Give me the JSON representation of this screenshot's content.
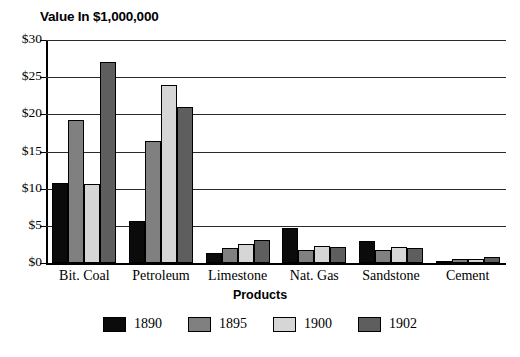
{
  "chart_data": {
    "type": "bar",
    "title": "Value In $1,000,000",
    "xlabel": "Products",
    "ylabel": "",
    "ylim": [
      0,
      30
    ],
    "ytick_labels": [
      "$0",
      "$5",
      "$10",
      "$15",
      "$20",
      "$25",
      "$30"
    ],
    "ytick_values": [
      0,
      5,
      10,
      15,
      20,
      25,
      30
    ],
    "grid": true,
    "legend_position": "bottom",
    "categories": [
      "Bit. Coal",
      "Petroleum",
      "Limestone",
      "Nat. Gas",
      "Sandstone",
      "Cement"
    ],
    "series": [
      {
        "name": "1890",
        "color": "#0b0b0b",
        "values": [
          10.8,
          5.7,
          1.4,
          4.7,
          3.0,
          0.3
        ]
      },
      {
        "name": "1895",
        "color": "#808080",
        "values": [
          19.3,
          16.4,
          2.0,
          1.7,
          1.7,
          0.5
        ]
      },
      {
        "name": "1900",
        "color": "#d6d6d6",
        "values": [
          10.6,
          24.0,
          2.5,
          2.3,
          2.2,
          0.6
        ]
      },
      {
        "name": "1902",
        "color": "#5e5e5e",
        "values": [
          27.0,
          21.0,
          3.1,
          2.2,
          2.0,
          0.8
        ]
      }
    ]
  }
}
